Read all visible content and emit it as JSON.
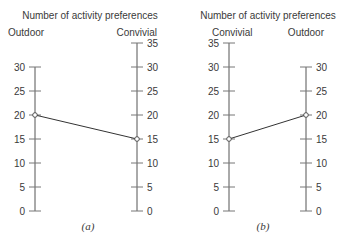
{
  "chart_data": [
    {
      "type": "line",
      "panel": "(a)",
      "title": "Number of activity preferences",
      "axes": [
        {
          "name": "Outdoor",
          "range": [
            0,
            30
          ],
          "ticks": [
            0,
            5,
            10,
            15,
            20,
            25,
            30
          ],
          "tick_side": "left"
        },
        {
          "name": "Convivial",
          "range": [
            0,
            35
          ],
          "ticks": [
            0,
            5,
            10,
            15,
            20,
            25,
            30,
            35
          ],
          "tick_side": "right"
        }
      ],
      "points": [
        {
          "axis": "Outdoor",
          "value": 20
        },
        {
          "axis": "Convivial",
          "value": 15
        }
      ]
    },
    {
      "type": "line",
      "panel": "(b)",
      "title": "Number of activity preferences",
      "axes": [
        {
          "name": "Convivial",
          "range": [
            0,
            35
          ],
          "ticks": [
            0,
            5,
            10,
            15,
            20,
            25,
            30,
            35
          ],
          "tick_side": "left"
        },
        {
          "name": "Outdoor",
          "range": [
            0,
            30
          ],
          "ticks": [
            0,
            5,
            10,
            15,
            20,
            25,
            30
          ],
          "tick_side": "right"
        }
      ],
      "points": [
        {
          "axis": "Convivial",
          "value": 15
        },
        {
          "axis": "Outdoor",
          "value": 20
        }
      ]
    }
  ],
  "layout": {
    "y_zero": 211,
    "px_per_unit": 4.8,
    "panels": [
      {
        "left_x": 35,
        "right_x": 137,
        "title_x": 90,
        "title_y": 19,
        "left_name_x": 8,
        "right_name_x": 157,
        "name_y": 36,
        "caption_x": 88,
        "caption_y": 230
      },
      {
        "left_x": 229,
        "right_x": 306,
        "title_x": 268,
        "title_y": 19,
        "left_name_x": 212,
        "right_name_x": 324,
        "name_y": 36,
        "caption_x": 263,
        "caption_y": 230
      }
    ]
  }
}
